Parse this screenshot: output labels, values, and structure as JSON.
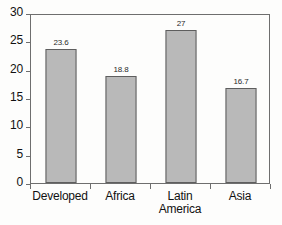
{
  "chart_data": {
    "type": "bar",
    "title": "",
    "subtitle": "",
    "xlabel": "",
    "ylabel": "",
    "categories": [
      "Developed",
      "Africa",
      "Latin America",
      "Asia"
    ],
    "category_lines": [
      [
        "Developed"
      ],
      [
        "Africa"
      ],
      [
        "Latin",
        "America"
      ],
      [
        "Asia"
      ]
    ],
    "values": [
      23.6,
      18.8,
      27,
      16.7
    ],
    "value_labels": [
      "23.6",
      "18.8",
      "27",
      "16.7"
    ],
    "ylim": [
      0,
      30
    ],
    "ytick_values": [
      0,
      5,
      10,
      15,
      20,
      25,
      30
    ],
    "ytick_labels": [
      "0",
      "5",
      "10",
      "15",
      "20",
      "25",
      "30"
    ],
    "grid": false,
    "legend": null,
    "legend_position": "none",
    "bar_fill_color": "#b9b9b9",
    "bar_edge_color": "#5e5e5e",
    "axis_color": "#6e6e6e",
    "background_color": "#fdfdfc",
    "text_color": "#111111"
  }
}
